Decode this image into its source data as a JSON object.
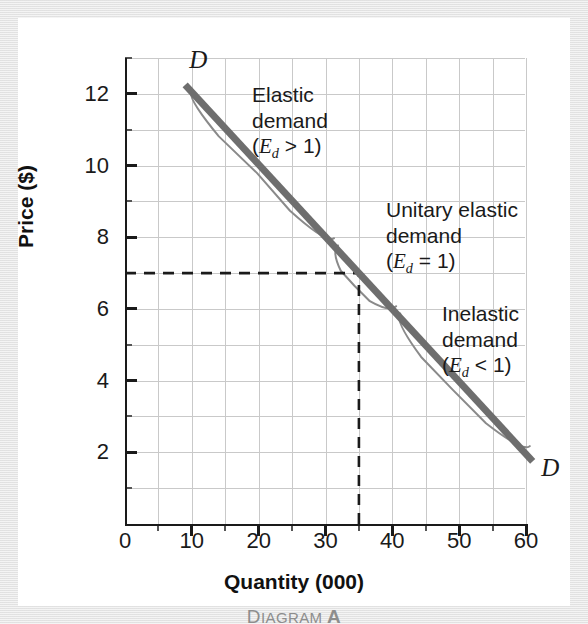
{
  "chart_data": {
    "type": "line",
    "title": "",
    "xlabel": "Quantity (000)",
    "ylabel": "Price ($)",
    "caption": "Diagram A",
    "xlim": [
      0,
      60
    ],
    "ylim": [
      0,
      13
    ],
    "grid": true,
    "x_ticks_major": [
      0,
      10,
      20,
      30,
      40,
      50,
      60
    ],
    "x_ticks_minor": [
      5,
      15,
      25,
      35,
      45,
      55
    ],
    "x_tick_labels": [
      "0",
      "10",
      "20",
      "30",
      "40",
      "50",
      "60"
    ],
    "y_ticks_major": [
      2,
      4,
      6,
      8,
      10,
      12
    ],
    "y_ticks_minor": [
      1,
      3,
      5,
      7,
      9,
      11,
      13
    ],
    "y_tick_labels": [
      "2",
      "4",
      "6",
      "8",
      "10",
      "12"
    ],
    "grid_x_step": 5,
    "grid_y_step": 1,
    "series": [
      {
        "name": "Demand curve",
        "label": "D",
        "color": "#6e6e6e",
        "width": 7,
        "points": [
          [
            9,
            12.25
          ],
          [
            61,
            1.75
          ]
        ]
      }
    ],
    "endpoint_labels": [
      {
        "text": "D",
        "x": 9.6,
        "y": 12.95
      },
      {
        "text": "D",
        "x": 62.3,
        "y": 1.55
      }
    ],
    "reference_lines": [
      {
        "orientation": "horizontal",
        "value": 7,
        "from": 0,
        "to": 35,
        "style": "dashed",
        "color": "#1a1a1a"
      },
      {
        "orientation": "vertical",
        "value": 35,
        "from": 0,
        "to": 7,
        "style": "dashed",
        "color": "#1a1a1a"
      }
    ],
    "braces": [
      {
        "name": "elastic-brace",
        "from": [
          10.4,
          12.2
        ],
        "to": [
          31.7,
          8.05
        ],
        "notch": [
          22.0,
          10.2
        ]
      },
      {
        "name": "unitary-brace",
        "from": [
          32.3,
          7.85
        ],
        "to": [
          41.0,
          6.15
        ],
        "notch": [
          36.6,
          7.05
        ]
      },
      {
        "name": "inelastic-brace",
        "from": [
          41.6,
          5.95
        ],
        "to": [
          61.0,
          2.25
        ],
        "notch": [
          51.3,
          4.15
        ]
      }
    ],
    "annotations": [
      {
        "name": "elastic-demand-annotation",
        "lines": [
          "Elastic",
          "demand"
        ],
        "formula_prefix": "(",
        "formula_symbol": "E",
        "formula_sub": "d",
        "formula_operator": ">",
        "formula_value": "1)",
        "x": 234,
        "y": 64
      },
      {
        "name": "unitary-elastic-demand-annotation",
        "lines": [
          "Unitary elastic",
          "demand"
        ],
        "formula_prefix": "(",
        "formula_symbol": "E",
        "formula_sub": "d",
        "formula_operator": "=",
        "formula_value": "1)",
        "x": 368,
        "y": 179
      },
      {
        "name": "inelastic-demand-annotation",
        "lines": [
          "Inelastic",
          "demand"
        ],
        "formula_prefix": "(",
        "formula_symbol": "E",
        "formula_sub": "d",
        "formula_operator": "<",
        "formula_value": "1)",
        "x": 424,
        "y": 283
      }
    ],
    "colors": {
      "demand_line": "#6e6e6e",
      "brace": "#8a8a8a",
      "grid": "#c9c9c9",
      "axis": "#1a1a1a",
      "caption": "#8d8d8d",
      "card_background": "#ffffff",
      "page_background": "#e6e6e6"
    }
  }
}
